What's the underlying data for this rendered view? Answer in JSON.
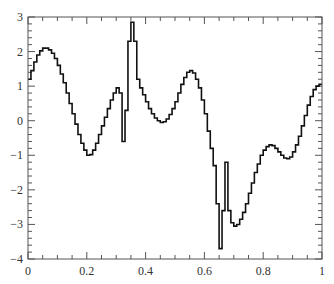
{
  "chart_data": {
    "type": "line",
    "style": "step-histogram",
    "title": "",
    "xlabel": "",
    "ylabel": "",
    "xlim": [
      0,
      1
    ],
    "ylim": [
      -4,
      3
    ],
    "grid": false,
    "legend": null,
    "x_ticks": [
      "0",
      "0.2",
      "0.4",
      "0.6",
      "0.8",
      "1"
    ],
    "y_ticks": [
      "-4",
      "-3",
      "-2",
      "-1",
      "0",
      "1",
      "2",
      "3"
    ],
    "bin_width": 0.01,
    "series": [
      {
        "name": "signal",
        "color": "#111111",
        "x_start": 0.0,
        "values": [
          1.2,
          1.45,
          1.7,
          1.9,
          2.02,
          2.1,
          2.1,
          2.05,
          1.95,
          1.8,
          1.6,
          1.35,
          1.1,
          0.8,
          0.5,
          0.2,
          -0.1,
          -0.4,
          -0.65,
          -0.85,
          -1.0,
          -0.98,
          -0.85,
          -0.65,
          -0.4,
          -0.15,
          0.1,
          0.35,
          0.6,
          0.8,
          0.95,
          0.8,
          -0.6,
          0.3,
          2.3,
          2.85,
          2.3,
          1.2,
          0.95,
          0.75,
          0.55,
          0.35,
          0.2,
          0.08,
          0.0,
          -0.05,
          -0.03,
          0.05,
          0.18,
          0.35,
          0.55,
          0.8,
          1.05,
          1.25,
          1.4,
          1.45,
          1.38,
          1.2,
          0.95,
          0.6,
          0.2,
          -0.3,
          -0.8,
          -1.3,
          -2.4,
          -3.7,
          -2.6,
          -1.2,
          -2.6,
          -2.95,
          -3.05,
          -3.0,
          -2.85,
          -2.65,
          -2.4,
          -2.1,
          -1.8,
          -1.5,
          -1.25,
          -1.0,
          -0.85,
          -0.75,
          -0.7,
          -0.72,
          -0.8,
          -0.9,
          -1.0,
          -1.08,
          -1.1,
          -1.05,
          -0.9,
          -0.7,
          -0.45,
          -0.15,
          0.15,
          0.45,
          0.7,
          0.9,
          1.0,
          1.05
        ]
      }
    ]
  },
  "plot": {
    "frame_color": "#555555",
    "line_color": "#111111",
    "background": "#ffffff"
  }
}
